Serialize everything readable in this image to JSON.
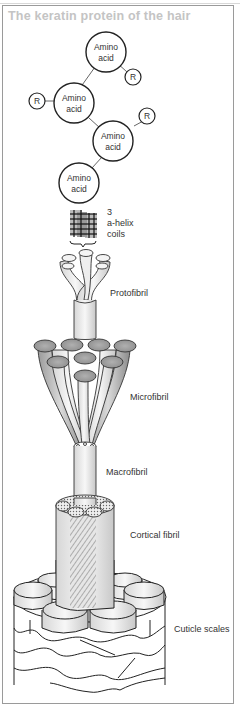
{
  "title": "The keratin protein of the hair",
  "diagram": {
    "amino_acids": [
      {
        "label_line1": "Amino",
        "label_line2": "acid"
      },
      {
        "label_line1": "Amino",
        "label_line2": "acid"
      },
      {
        "label_line1": "Amino",
        "label_line2": "acid"
      },
      {
        "label_line1": "Amino",
        "label_line2": "acid"
      }
    ],
    "r_groups": [
      "R",
      "R",
      "R"
    ],
    "labels": {
      "helix_line1": "3",
      "helix_line2": "a-helix",
      "helix_line3": "coils",
      "protofibril": "Protofibril",
      "microfibril": "Microfibril",
      "macrofibril": "Macrofibril",
      "cortical_fibril": "Cortical fibril",
      "cuticle_scales": "Cuticle scales"
    }
  },
  "colors": {
    "title": "#c4c4c4",
    "frame": "#9a9a9a",
    "line": "#222222",
    "fill_light": "#f2f2f2",
    "fill_mid": "#bdbdbd"
  }
}
